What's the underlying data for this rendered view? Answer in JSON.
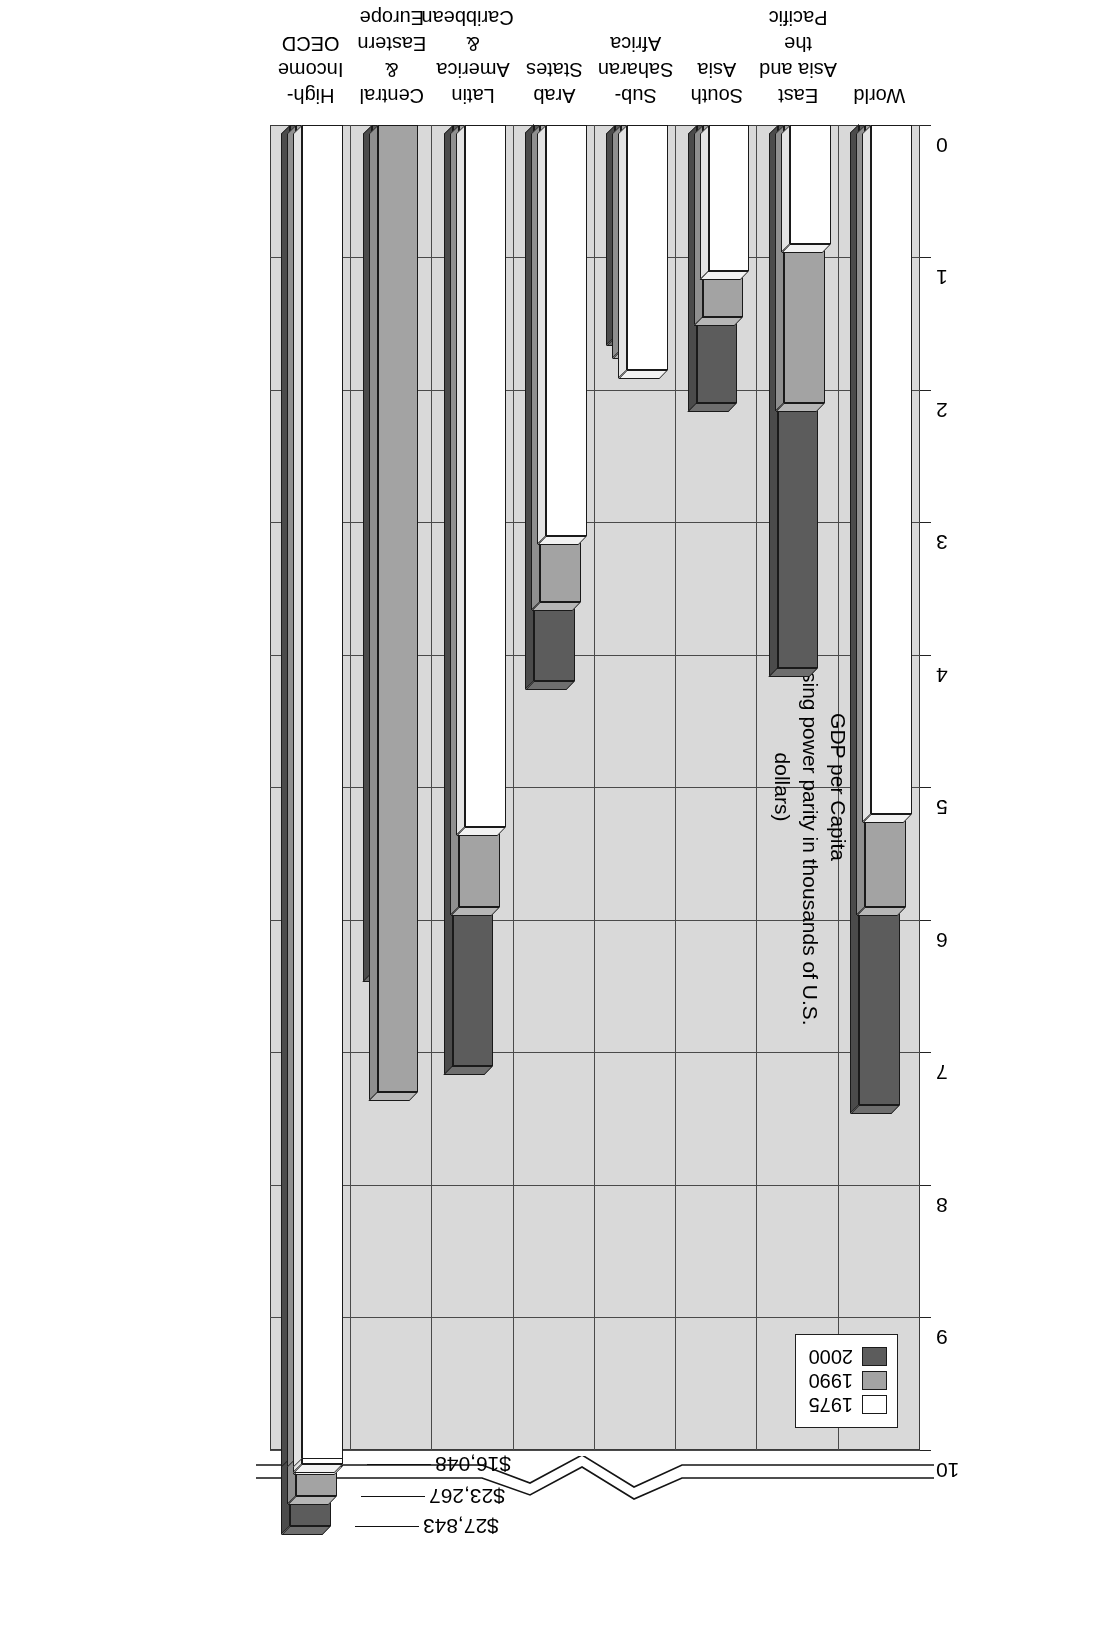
{
  "chart_data": {
    "type": "bar",
    "orientation": "vertical",
    "title": "",
    "xlabel": "",
    "ylabel": "GDP per Capita",
    "ylabel_sub": "(2000 purchasing power parity in thousands of U.S. dollars)",
    "ylim": [
      0,
      10
    ],
    "yticks": [
      0,
      1,
      2,
      3,
      4,
      5,
      6,
      7,
      8,
      9,
      10
    ],
    "ytick_labels": [
      "0",
      "1",
      "2",
      "3",
      "4",
      "5",
      "6",
      "7",
      "8",
      "9",
      "10"
    ],
    "grid": true,
    "axis_break": true,
    "axis_break_note": "Value axis is broken above 10; High-Income OECD bars extend beyond the break.",
    "legend_position": "upper-left",
    "categories": [
      "World",
      "East Asia and\nthe Pacific",
      "South Asia",
      "Sub-Saharan\nAfrica",
      "Arab States",
      "Latin America\n& Caribbean",
      "Central &\nEastern\nEurope & CIS",
      "High-Income\nOECD"
    ],
    "series": [
      {
        "name": "1975",
        "color": "#ffffff",
        "values": [
          5.2,
          0.9,
          1.1,
          1.85,
          3.1,
          5.3,
          null,
          16.048
        ]
      },
      {
        "name": "1990",
        "color": "#a3a3a3",
        "values": [
          5.9,
          2.1,
          1.45,
          1.7,
          3.6,
          5.9,
          7.3,
          23.267
        ]
      },
      {
        "name": "2000",
        "color": "#5c5c5c",
        "values": [
          7.4,
          4.1,
          2.1,
          1.6,
          4.2,
          7.1,
          6.4,
          27.843
        ]
      }
    ],
    "value_callouts": [
      {
        "label": "$27,843",
        "series": "2000"
      },
      {
        "label": "$23,267",
        "series": "1990"
      },
      {
        "label": "$16,048",
        "series": "1975"
      }
    ]
  },
  "axis": {
    "y_title_line1": "GDP per Capita",
    "y_title_line2": "(2000 purchasing power parity in thousands of U.S. dollars)"
  },
  "legend": {
    "items": [
      {
        "label": "1975"
      },
      {
        "label": "1990"
      },
      {
        "label": "2000"
      }
    ]
  },
  "colors": {
    "plot_background": "#d9d9d9",
    "series_1975": "#ffffff",
    "series_1990": "#a3a3a3",
    "series_2000": "#5c5c5c",
    "axis_line": "#3a3a3a",
    "text": "#000000"
  }
}
